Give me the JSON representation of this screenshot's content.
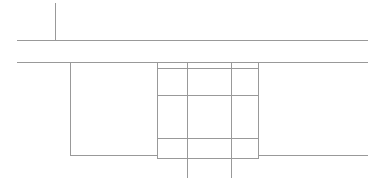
{
  "drawing": {
    "type": "technical-line-drawing",
    "title": "",
    "canvas": {
      "width": 382,
      "height": 188,
      "background": "#ffffff"
    },
    "stroke": {
      "color": "#999999",
      "width": 1
    },
    "annotations": [],
    "labels": [],
    "elements": [
      {
        "name": "upper-centerline-vertical",
        "kind": "line",
        "orientation": "vertical",
        "x1": 55.5,
        "y1": 3,
        "x2": 55.5,
        "y2": 41
      },
      {
        "name": "upper-slab-top-edge",
        "kind": "line",
        "orientation": "horizontal",
        "x1": 17,
        "y1": 40.5,
        "x2": 368,
        "y2": 40.5
      },
      {
        "name": "upper-slab-bottom-edge",
        "kind": "line",
        "orientation": "horizontal",
        "x1": 17,
        "y1": 62.5,
        "x2": 368,
        "y2": 62.5
      },
      {
        "name": "left-column-vertical",
        "kind": "line",
        "orientation": "vertical",
        "x1": 70.5,
        "y1": 62,
        "x2": 70.5,
        "y2": 155
      },
      {
        "name": "left-base-horizontal",
        "kind": "line",
        "orientation": "horizontal",
        "x1": 70,
        "y1": 155.5,
        "x2": 157,
        "y2": 155.5
      },
      {
        "name": "right-base-horizontal",
        "kind": "line",
        "orientation": "horizontal",
        "x1": 258,
        "y1": 155.5,
        "x2": 368,
        "y2": 155.5
      },
      {
        "name": "center-box-left-edge",
        "kind": "line",
        "orientation": "vertical",
        "x1": 157.5,
        "y1": 62,
        "x2": 157.5,
        "y2": 159
      },
      {
        "name": "center-box-right-edge",
        "kind": "line",
        "orientation": "vertical",
        "x1": 258.5,
        "y1": 62,
        "x2": 258.5,
        "y2": 159
      },
      {
        "name": "center-box-top-edge",
        "kind": "line",
        "orientation": "horizontal",
        "x1": 157,
        "y1": 68.5,
        "x2": 259,
        "y2": 68.5
      },
      {
        "name": "center-box-bottom-edge",
        "kind": "line",
        "orientation": "horizontal",
        "x1": 157,
        "y1": 158.5,
        "x2": 259,
        "y2": 158.5
      },
      {
        "name": "center-box-divider-upper",
        "kind": "line",
        "orientation": "horizontal",
        "x1": 157,
        "y1": 95.5,
        "x2": 259,
        "y2": 95.5
      },
      {
        "name": "center-box-divider-lower",
        "kind": "line",
        "orientation": "horizontal",
        "x1": 157,
        "y1": 138.5,
        "x2": 259,
        "y2": 138.5
      },
      {
        "name": "center-grid-vertical-left",
        "kind": "line",
        "orientation": "vertical",
        "x1": 187.5,
        "y1": 62,
        "x2": 187.5,
        "y2": 178
      },
      {
        "name": "center-grid-vertical-right",
        "kind": "line",
        "orientation": "vertical",
        "x1": 231.5,
        "y1": 62,
        "x2": 231.5,
        "y2": 178
      }
    ]
  }
}
